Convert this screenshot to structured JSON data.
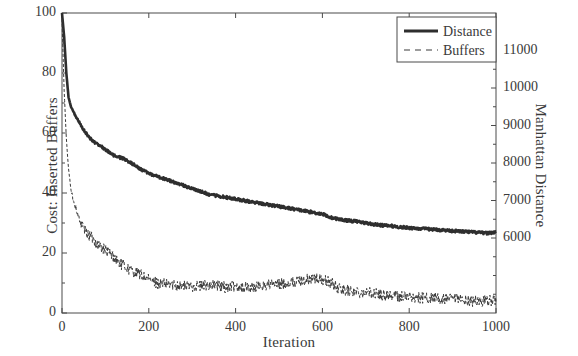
{
  "chart_data": {
    "type": "line",
    "title": "",
    "xlabel": "Iteration",
    "ylabel": "Cost: Inserted Buffers",
    "ylabel_right": "Manhattan Distance",
    "xlim": [
      0,
      1000
    ],
    "ylim": [
      0,
      100
    ],
    "ylim_right": [
      4000,
      12000
    ],
    "xticks": [
      0,
      200,
      400,
      600,
      800,
      1000
    ],
    "xtick_labels": [
      "0",
      "200",
      "400",
      "600",
      "800",
      "1000"
    ],
    "yticks": [
      0,
      20,
      40,
      60,
      80,
      100
    ],
    "ytick_labels": [
      "0",
      "20",
      "40",
      "60",
      "80",
      "100"
    ],
    "yticks_right": [
      6000,
      7000,
      8000,
      9000,
      10000,
      11000
    ],
    "ytick_labels_right": [
      "6000",
      "7000",
      "8000",
      "9000",
      "10000",
      "11000"
    ],
    "grid": false,
    "legend_position": "top-right",
    "legend": [
      "Distance",
      "Buffers"
    ],
    "series": [
      {
        "name": "Distance",
        "style": "solid",
        "color": "#2e2e2e",
        "width": 2.6,
        "axis": "right",
        "x": [
          0,
          5,
          10,
          15,
          20,
          25,
          30,
          40,
          50,
          60,
          70,
          80,
          90,
          100,
          120,
          140,
          160,
          180,
          200,
          220,
          240,
          260,
          280,
          300,
          320,
          340,
          360,
          380,
          400,
          420,
          440,
          460,
          480,
          500,
          520,
          540,
          560,
          580,
          600,
          620,
          640,
          660,
          680,
          700,
          720,
          740,
          760,
          780,
          800,
          820,
          840,
          860,
          880,
          900,
          920,
          940,
          960,
          980,
          1000
        ],
        "y": [
          100,
          92,
          80,
          72,
          69,
          67.5,
          66,
          63.5,
          61,
          59,
          57.5,
          56.5,
          55.5,
          54.5,
          52.5,
          51.5,
          50,
          48,
          46.5,
          45.5,
          44.5,
          43.5,
          42.5,
          41.5,
          40.5,
          39.5,
          39,
          38.5,
          38,
          37.5,
          37,
          36.5,
          36,
          35.5,
          35,
          34.5,
          34,
          33.5,
          33,
          31.8,
          31.2,
          30.8,
          30.5,
          30,
          29.5,
          29.2,
          29,
          28.6,
          28.4,
          28.2,
          28,
          27.8,
          27.6,
          27.4,
          27.2,
          27,
          26.8,
          26.6,
          27
        ],
        "y_right": [
          12000,
          11360,
          10400,
          9760,
          9520,
          9400,
          9280,
          9080,
          8880,
          8720,
          8600,
          8520,
          8440,
          8360,
          8200,
          8120,
          8000,
          7840,
          7720,
          7640,
          7560,
          7480,
          7400,
          7320,
          7240,
          7160,
          7120,
          7080,
          7040,
          7000,
          6960,
          6920,
          6880,
          6840,
          6800,
          6760,
          6720,
          6680,
          6640,
          6544,
          6496,
          6464,
          6440,
          6400,
          6360,
          6336,
          6320,
          6288,
          6272,
          6256,
          6240,
          6224,
          6208,
          6192,
          6176,
          6160,
          6144,
          6128,
          6160
        ]
      },
      {
        "name": "Buffers",
        "style": "dashed",
        "color": "#3a3a3a",
        "width": 1.0,
        "axis": "left",
        "x": [
          0,
          5,
          10,
          15,
          20,
          25,
          30,
          40,
          50,
          60,
          70,
          80,
          90,
          100,
          110,
          120,
          130,
          140,
          150,
          160,
          170,
          180,
          190,
          200,
          220,
          240,
          260,
          280,
          300,
          320,
          340,
          360,
          380,
          400,
          420,
          440,
          460,
          480,
          500,
          520,
          540,
          560,
          580,
          600,
          620,
          640,
          660,
          680,
          700,
          720,
          740,
          760,
          780,
          800,
          820,
          840,
          860,
          880,
          900,
          920,
          940,
          960,
          980,
          1000
        ],
        "y": [
          98,
          74,
          58,
          48,
          42,
          38,
          36,
          31,
          28,
          26,
          25,
          23,
          22,
          21,
          20,
          18.5,
          17,
          16,
          15,
          14,
          13.5,
          13,
          12,
          11,
          10,
          9.5,
          9.5,
          9,
          9,
          9,
          9.5,
          9,
          8.5,
          9,
          8.5,
          8.5,
          9,
          9.5,
          9.5,
          10,
          10.5,
          11,
          11.5,
          11,
          10,
          8,
          7.5,
          7,
          7,
          6.5,
          6,
          6,
          5.5,
          5.5,
          5,
          5,
          5,
          4.5,
          4.5,
          4.5,
          4,
          4,
          4,
          4.5
        ]
      }
    ]
  },
  "axes": {
    "x_label": "Iteration",
    "y_left_label": "Cost: Inserted Buffers",
    "y_right_label": "Manhattan Distance"
  },
  "legend": {
    "items": [
      {
        "label": "Distance",
        "style": "solid"
      },
      {
        "label": "Buffers",
        "style": "dashed"
      }
    ]
  },
  "colors": {
    "background": "#ffffff",
    "axis": "#4a4a4a",
    "distance_line": "#2e2e2e",
    "buffers_line": "#3a3a3a",
    "text": "#3a3a3a"
  }
}
